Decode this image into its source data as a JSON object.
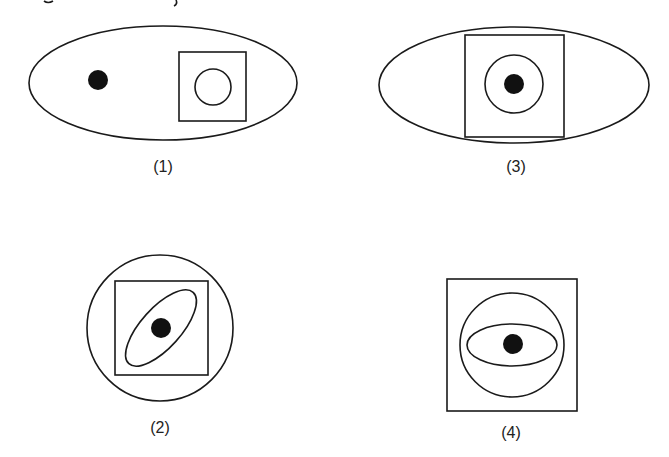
{
  "figure": {
    "panels": [
      {
        "id": "1",
        "label": "(1)",
        "description": "Large horizontal ellipse containing a black dot on the left and a square with a small circle inside on the right"
      },
      {
        "id": "2",
        "label": "(2)",
        "description": "Circle containing a square, containing a tilted ellipse with a black dot at center"
      },
      {
        "id": "3",
        "label": "(3)",
        "description": "Horizontal ellipse overlapped by a square, containing a circle with a black dot at center"
      },
      {
        "id": "4",
        "label": "(4)",
        "description": "Square containing a circle, containing a horizontal ellipse with a black dot at center"
      }
    ],
    "colors": {
      "stroke": "#1a1a1a",
      "dot": "#111111",
      "background": "#ffffff"
    }
  }
}
